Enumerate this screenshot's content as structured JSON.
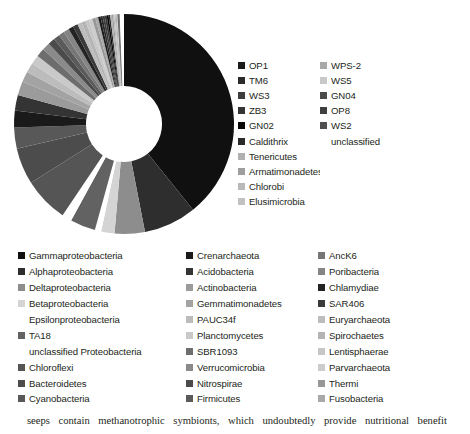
{
  "figure": {
    "caption": "seeps contain methanotrophic symbionts, which undoubtedly provide nutritional benefit"
  },
  "legend_upper": {
    "columns": [
      {
        "name": "upper-column-1",
        "items": [
          {
            "label": "OP1",
            "color": "#1b1b1b"
          },
          {
            "label": "TM6",
            "color": "#2b2b2b"
          },
          {
            "label": "WS3",
            "color": "#3d3d3d"
          },
          {
            "label": "ZB3",
            "color": "#353535"
          },
          {
            "label": "GN02",
            "color": "#080808"
          },
          {
            "label": "Caldithrix",
            "color": "#2a2a2a"
          },
          {
            "label": "Tenericutes",
            "color": "#b0b0b0"
          },
          {
            "label": "Armatimonadetes",
            "color": "#9e9e9e"
          },
          {
            "label": "Chlorobi",
            "color": "#b9b9b9"
          },
          {
            "label": "Elusimicrobia",
            "color": "#c2c2c2"
          }
        ]
      },
      {
        "name": "upper-column-2",
        "items": [
          {
            "label": "WPS-2",
            "color": "#a8a8a8"
          },
          {
            "label": "WS5",
            "color": "#c8c8c8"
          },
          {
            "label": "GN04",
            "color": "#4a4a4a"
          },
          {
            "label": "OP8",
            "color": "#3f3f3f"
          },
          {
            "label": "WS2",
            "color": "#4f4f4f"
          },
          {
            "label": "unclassified",
            "color": "none"
          }
        ]
      }
    ]
  },
  "legend_lower": {
    "columns": [
      {
        "name": "lower-column-1",
        "items": [
          {
            "label": "Gammaproteobacteria",
            "color": "#101010"
          },
          {
            "label": "Alphaproteobacteria",
            "color": "#2e2e2e"
          },
          {
            "label": "Deltaproteobacteria",
            "color": "#8d8d8d"
          },
          {
            "label": "Betaproteobacteria",
            "color": "#d4d4d4"
          },
          {
            "label": "Epsilonproteobacteria",
            "color": "none"
          },
          {
            "label": "TA18",
            "color": "#626262"
          },
          {
            "label": "unclassified Proteobacteria",
            "color": "none"
          },
          {
            "label": "Chloroflexi",
            "color": "#555555"
          },
          {
            "label": "Bacteroidetes",
            "color": "#4c4c4c"
          },
          {
            "label": "Cyanobacteria",
            "color": "#585858"
          }
        ]
      },
      {
        "name": "lower-column-2",
        "items": [
          {
            "label": "Crenarchaeota",
            "color": "#1a1a1a"
          },
          {
            "label": "Acidobacteria",
            "color": "#343434"
          },
          {
            "label": "Actinobacteria",
            "color": "#9b9b9b"
          },
          {
            "label": "Gemmatimonadetes",
            "color": "#a3a3a3"
          },
          {
            "label": "PAUC34f",
            "color": "#bcbcbc"
          },
          {
            "label": "Planctomycetes",
            "color": "#c9c9c9"
          },
          {
            "label": "SBR1093",
            "color": "#6d6d6d"
          },
          {
            "label": "Verrucomicrobia",
            "color": "#8a8a8a"
          },
          {
            "label": "Nitrospirae",
            "color": "#4b4b4b"
          },
          {
            "label": "Firmicutes",
            "color": "#5a5a5a"
          }
        ]
      },
      {
        "name": "lower-column-3",
        "items": [
          {
            "label": "AncK6",
            "color": "#767676"
          },
          {
            "label": "Poribacteria",
            "color": "#858585"
          },
          {
            "label": "Chlamydiae",
            "color": "#232323"
          },
          {
            "label": "SAR406",
            "color": "#3a3a3a"
          },
          {
            "label": "Euryarchaeota",
            "color": "#bdbdbd"
          },
          {
            "label": "Spirochaetes",
            "color": "#b4b4b4"
          },
          {
            "label": "Lentisphaerae",
            "color": "#c6c6c6"
          },
          {
            "label": "Parvarchaeota",
            "color": "#cccccc"
          },
          {
            "label": "Thermi",
            "color": "#979797"
          },
          {
            "label": "Fusobacteria",
            "color": "#a9a9a9"
          }
        ]
      }
    ]
  },
  "chart_data": {
    "type": "pie",
    "variant": "donut",
    "title": "",
    "start_angle_deg": 0,
    "direction": "clockwise",
    "inner_radius_px": 38,
    "outer_radius_px": 110,
    "center_px": [
      115,
      115
    ],
    "legend_position": "right-and-below",
    "grid": false,
    "labels": [
      "Gammaproteobacteria",
      "Alphaproteobacteria",
      "Deltaproteobacteria",
      "Betaproteobacteria",
      "Epsilonproteobacteria",
      "TA18",
      "unclassified Proteobacteria",
      "Chloroflexi",
      "Bacteroidetes",
      "Cyanobacteria",
      "Crenarchaeota",
      "Acidobacteria",
      "Actinobacteria",
      "Gemmatimonadetes",
      "PAUC34f",
      "Planctomycetes",
      "SBR1093",
      "Verrucomicrobia",
      "Nitrospirae",
      "Firmicutes",
      "AncK6",
      "Poribacteria",
      "Chlamydiae",
      "SAR406",
      "Euryarchaeota",
      "Spirochaetes",
      "Lentisphaerae",
      "Parvarchaeota",
      "Thermi",
      "Fusobacteria",
      "OP1",
      "TM6",
      "WS3",
      "ZB3",
      "GN02",
      "Caldithrix",
      "Tenericutes",
      "Armatimonadetes",
      "Chlorobi",
      "Elusimicrobia",
      "WPS-2",
      "WS5",
      "GN04",
      "OP8",
      "WS2",
      "unclassified"
    ],
    "values": [
      38.0,
      7.5,
      4.3,
      1.9,
      0.9,
      3.6,
      1.4,
      6.4,
      5.2,
      3.0,
      2.4,
      2.2,
      2.0,
      1.5,
      1.4,
      1.3,
      1.2,
      1.1,
      1.0,
      0.9,
      0.8,
      0.8,
      0.7,
      0.7,
      0.6,
      0.6,
      0.5,
      0.5,
      0.45,
      0.4,
      0.35,
      0.3,
      0.3,
      0.28,
      0.26,
      0.24,
      0.22,
      0.2,
      0.18,
      0.16,
      0.15,
      0.13,
      0.12,
      0.1,
      0.09,
      0.6
    ],
    "colors": [
      "#101010",
      "#2e2e2e",
      "#8d8d8d",
      "#d4d4d4",
      "#ffffff",
      "#626262",
      "#ffffff",
      "#555555",
      "#4c4c4c",
      "#585858",
      "#1a1a1a",
      "#343434",
      "#9b9b9b",
      "#a3a3a3",
      "#bcbcbc",
      "#c9c9c9",
      "#6d6d6d",
      "#8a8a8a",
      "#4b4b4b",
      "#5a5a5a",
      "#767676",
      "#858585",
      "#232323",
      "#3a3a3a",
      "#bdbdbd",
      "#b4b4b4",
      "#c6c6c6",
      "#cccccc",
      "#979797",
      "#a9a9a9",
      "#1b1b1b",
      "#2b2b2b",
      "#3d3d3d",
      "#353535",
      "#080808",
      "#2a2a2a",
      "#b0b0b0",
      "#9e9e9e",
      "#b9b9b9",
      "#c2c2c2",
      "#a8a8a8",
      "#c8c8c8",
      "#4a4a4a",
      "#3f3f3f",
      "#4f4f4f",
      "#ffffff"
    ],
    "unit": "percent"
  }
}
